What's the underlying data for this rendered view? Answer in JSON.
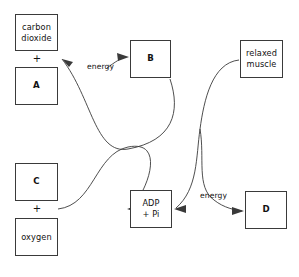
{
  "diagram": {
    "stroke_color": "#3a3a3a",
    "background_color": "#ffffff",
    "nodes": [
      {
        "id": "carbon-dioxide",
        "label": "carbon\ndioxide",
        "bold": false,
        "x": 15,
        "y": 14,
        "w": 43,
        "h": 37
      },
      {
        "id": "a",
        "label": "A",
        "bold": true,
        "x": 15,
        "y": 67,
        "w": 43,
        "h": 38
      },
      {
        "id": "c",
        "label": "C",
        "bold": true,
        "x": 15,
        "y": 163,
        "w": 43,
        "h": 38
      },
      {
        "id": "oxygen",
        "label": "oxygen",
        "bold": false,
        "x": 15,
        "y": 218,
        "w": 43,
        "h": 38
      },
      {
        "id": "b",
        "label": "B",
        "bold": true,
        "x": 130,
        "y": 40,
        "w": 41,
        "h": 38
      },
      {
        "id": "adp-pi",
        "label": "ADP\n+ Pi",
        "bold": false,
        "x": 130,
        "y": 190,
        "w": 42,
        "h": 38
      },
      {
        "id": "relaxed-muscle",
        "label": "relaxed\nmuscle",
        "bold": false,
        "x": 240,
        "y": 40,
        "w": 43,
        "h": 38
      },
      {
        "id": "d",
        "label": "D",
        "bold": true,
        "x": 245,
        "y": 191,
        "w": 42,
        "h": 38
      }
    ],
    "plus_signs": [
      {
        "id": "plus-top",
        "label": "+",
        "x": 27,
        "y": 54,
        "w": 20
      },
      {
        "id": "plus-bottom",
        "label": "+",
        "x": 27,
        "y": 204,
        "w": 20
      }
    ],
    "energy_labels": [
      {
        "id": "energy-top",
        "label": "energy",
        "x": 87,
        "y": 62
      },
      {
        "id": "energy-bottom",
        "label": "energy",
        "x": 200,
        "y": 191
      }
    ],
    "edges": [
      {
        "id": "edge-b-to-products",
        "from": "B",
        "to": "carbon dioxide + A",
        "arrow": true,
        "path": "M 170 79 C 178 110 174 140 130 150 C 96 158 92 100 60 59"
      },
      {
        "id": "edge-reactants-to-adp",
        "from": "C + oxygen",
        "to": "ADP + Pi",
        "arrow": true,
        "path": "M 58 209 C 92 206 96 152 130 144 C 172 136 144 194 127 209"
      },
      {
        "id": "edge-muscle-to-adp",
        "from": "relaxed muscle",
        "to": "ADP + Pi",
        "arrow": true,
        "path": "M 239 60 C 212 64 206 104 200 130 C 196 152 200 185 176 208"
      },
      {
        "id": "edge-adp-to-d",
        "from": "ADP + Pi region",
        "to": "D",
        "arrow": true,
        "path": "M 200 128 C 204 155 197 186 216 202 C 226 210 236 211 243 211"
      },
      {
        "id": "edge-energy-to-b",
        "from": "energy",
        "to": "B",
        "arrow": true,
        "path": "M 106 68 C 116 62 122 58 127 57"
      }
    ]
  }
}
